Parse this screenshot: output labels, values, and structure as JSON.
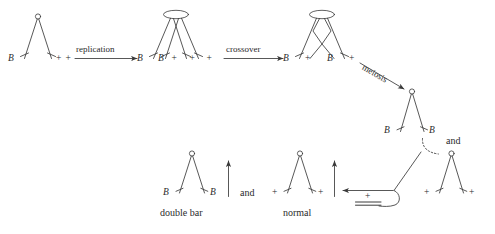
{
  "figure": {
    "type": "genetics-diagram",
    "background_color": "#ffffff",
    "line_color": "#3a3a3a",
    "text_color": "#2b2b2b"
  },
  "arrows": {
    "replication": "replication",
    "crossover": "crossover",
    "meiosis": "meiosis"
  },
  "connectors": {
    "and_top": "and",
    "and_bottom": "and"
  },
  "stages": {
    "stage1": {
      "name": "unreplicated-chromosome-pair",
      "centromere": "single-circle",
      "arm_labels": [
        "B",
        "+"
      ],
      "trailing_label": "+"
    },
    "stage2": {
      "name": "replicated-chromosome-pair",
      "centromere": "ellipse",
      "arm_labels": [
        "B",
        "B",
        "+",
        "+"
      ],
      "leading_label": "B",
      "trailing_label": "+"
    },
    "stage3": {
      "name": "crossover-chromosome-pair",
      "centromere": "ellipse",
      "arm_labels": [
        "B",
        "+",
        "B",
        "+"
      ],
      "trailing_label": "+"
    },
    "product_top": {
      "name": "double-bar-product-chromosome",
      "centromere": "single-circle",
      "arm_labels": [
        "B",
        "B"
      ]
    },
    "product_right": {
      "name": "normal-product-chromosome",
      "centromere": "single-circle",
      "arm_labels": [
        "+",
        "+"
      ]
    },
    "result_double_bar": {
      "name": "double-bar-result",
      "centromere": "single-circle",
      "arm_labels": [
        "B",
        "B"
      ],
      "caption": "double bar"
    },
    "result_normal": {
      "name": "normal-result",
      "centromere": "single-circle",
      "arm_labels": [
        "+",
        "+"
      ],
      "caption": "normal"
    },
    "loop_marker": {
      "name": "deleted-fragment",
      "label": "+",
      "symbol": "double-line"
    }
  }
}
